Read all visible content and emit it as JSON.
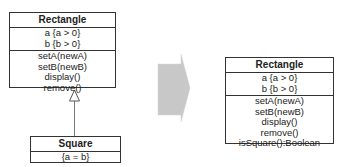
{
  "diagram": {
    "before": {
      "superclass": {
        "name": "Rectangle",
        "attributes": [
          "a  {a > 0}",
          "b  {b > 0}"
        ],
        "operations": [
          "setA(newA)",
          "setB(newB)",
          "display()",
          "remove()"
        ]
      },
      "subclass": {
        "name": "Square",
        "attributes": [
          "{a = b}"
        ]
      },
      "relationship": "generalization"
    },
    "transform_arrow": {
      "direction": "right",
      "color": "#c8c8c8"
    },
    "after": {
      "class": {
        "name": "Rectangle",
        "attributes": [
          "a  {a > 0}",
          "b  {b > 0}"
        ],
        "operations": [
          "setA(newA)",
          "setB(newB)",
          "display()",
          "remove()",
          "isSquare():Boolean"
        ]
      }
    }
  }
}
